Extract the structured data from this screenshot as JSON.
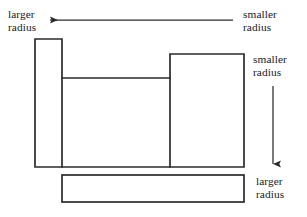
{
  "figure": {
    "name": "stepped-shaft-radius-diagram",
    "stroke_color": "#2b2b2b",
    "fill_color": "#ffffff",
    "background_color": "#ffffff",
    "labels": {
      "top_left": {
        "line1": "larger",
        "line2": "radius"
      },
      "top_right": {
        "line1": "smaller",
        "line2": "radius"
      },
      "mid_right": {
        "line1": "smaller",
        "line2": "radius"
      },
      "bottom_right": {
        "line1": "larger",
        "line2": "radius"
      }
    },
    "arrows": {
      "horizontal": {
        "direction": "left",
        "from_x": 233,
        "to_x": 47,
        "y": 20
      },
      "vertical": {
        "direction": "down",
        "x": 273,
        "from_y": 86,
        "to_y": 167
      }
    },
    "shapes": {
      "left_column": {
        "x": 35,
        "y": 39,
        "width": 27,
        "height": 128
      },
      "right_block": {
        "x": 170,
        "y": 54,
        "width": 74,
        "height": 113
      },
      "middle_step": {
        "x": 62,
        "y": 78,
        "width": 108,
        "height": 89
      },
      "bottom_bar": {
        "x": 62,
        "y": 175,
        "width": 182,
        "height": 27
      }
    }
  }
}
